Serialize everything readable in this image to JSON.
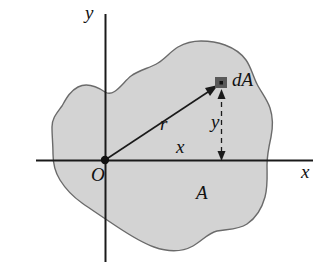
{
  "figure": {
    "background_color": "#ffffff",
    "region_fill_color": "#d3d3d3",
    "region_stroke_color": "#6b6b6b",
    "axis_color": "#1a1a1a",
    "marker_color": "#595959",
    "labels": {
      "y_axis": "y",
      "x_axis": "x",
      "origin": "O",
      "radius": "r",
      "area_element": "dA",
      "x_distance": "x",
      "y_distance": "y",
      "area": "A"
    },
    "geometry": {
      "origin": {
        "x": 105,
        "y": 160
      },
      "area_element": {
        "x": 221,
        "y": 83
      },
      "x_axis_extent": [
        36,
        313
      ],
      "y_axis_extent": [
        14,
        262
      ]
    }
  }
}
